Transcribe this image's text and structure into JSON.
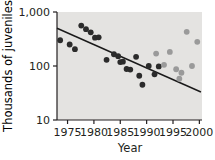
{
  "chart_data": {
    "type": "scatter",
    "title": "",
    "xlabel": "Year",
    "ylabel": "Thousands of juveniles",
    "xlim": [
      1973,
      2000.5
    ],
    "ylim": [
      10,
      1000
    ],
    "yscale": "log",
    "grid": false,
    "legend": "none",
    "plot_background": "#e4e3e1",
    "xticks": [
      1975,
      1980,
      1985,
      1990,
      1995,
      2000
    ],
    "xtick_labels": [
      "1975",
      "1980",
      "1985",
      "1990",
      "1995",
      "2000"
    ],
    "yticks": [
      10,
      100,
      1000
    ],
    "ytick_labels": [
      "10",
      "100",
      "1,000"
    ],
    "series": [
      {
        "name": "dark-points",
        "color": "#2b2b2b",
        "marker": "circle",
        "points": [
          {
            "x": 1973.6,
            "y": 300
          },
          {
            "x": 1975.4,
            "y": 250
          },
          {
            "x": 1976.4,
            "y": 205
          },
          {
            "x": 1977.6,
            "y": 560
          },
          {
            "x": 1978.5,
            "y": 480
          },
          {
            "x": 1979.4,
            "y": 420
          },
          {
            "x": 1980.2,
            "y": 335
          },
          {
            "x": 1980.9,
            "y": 340
          },
          {
            "x": 1982.4,
            "y": 130
          },
          {
            "x": 1983.8,
            "y": 165
          },
          {
            "x": 1984.6,
            "y": 152
          },
          {
            "x": 1985.0,
            "y": 118
          },
          {
            "x": 1985.5,
            "y": 120
          },
          {
            "x": 1986.2,
            "y": 88
          },
          {
            "x": 1986.9,
            "y": 86
          },
          {
            "x": 1988.0,
            "y": 148
          },
          {
            "x": 1988.6,
            "y": 66
          },
          {
            "x": 1989.2,
            "y": 45
          },
          {
            "x": 1990.4,
            "y": 100
          },
          {
            "x": 1991.5,
            "y": 70
          },
          {
            "x": 1992.3,
            "y": 98
          }
        ]
      },
      {
        "name": "light-points",
        "color": "#9a9a9a",
        "marker": "circle",
        "points": [
          {
            "x": 1991.8,
            "y": 170
          },
          {
            "x": 1993.3,
            "y": 105
          },
          {
            "x": 1994.4,
            "y": 182
          },
          {
            "x": 1995.6,
            "y": 87
          },
          {
            "x": 1996.2,
            "y": 58
          },
          {
            "x": 1996.6,
            "y": 75
          },
          {
            "x": 1997.6,
            "y": 430
          },
          {
            "x": 1998.6,
            "y": 100
          },
          {
            "x": 1999.6,
            "y": 280
          }
        ]
      }
    ],
    "trendline": {
      "name": "regression-line",
      "color": "#1a1a1a",
      "x_start": 1973.0,
      "y_start": 500,
      "x_end": 2000.3,
      "y_end": 33
    }
  }
}
